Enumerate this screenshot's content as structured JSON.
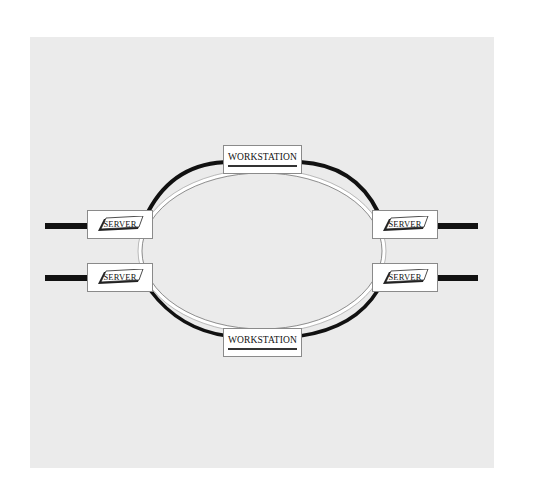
{
  "diagram": {
    "type": "ring-network",
    "background_color": "#ebebeb",
    "ring_color": "#111111",
    "nodes": {
      "top_workstation": {
        "label": "WORKSTATION"
      },
      "bottom_workstation": {
        "label": "WORKSTATION"
      },
      "left_upper_server": {
        "label": "SERVER"
      },
      "left_lower_server": {
        "label": "SERVER"
      },
      "right_upper_server": {
        "label": "SERVER"
      },
      "right_lower_server": {
        "label": "SERVER"
      }
    },
    "external_links": [
      {
        "from": "left_upper_server",
        "side": "left"
      },
      {
        "from": "left_lower_server",
        "side": "left"
      },
      {
        "from": "right_upper_server",
        "side": "right"
      },
      {
        "from": "right_lower_server",
        "side": "right"
      }
    ]
  }
}
